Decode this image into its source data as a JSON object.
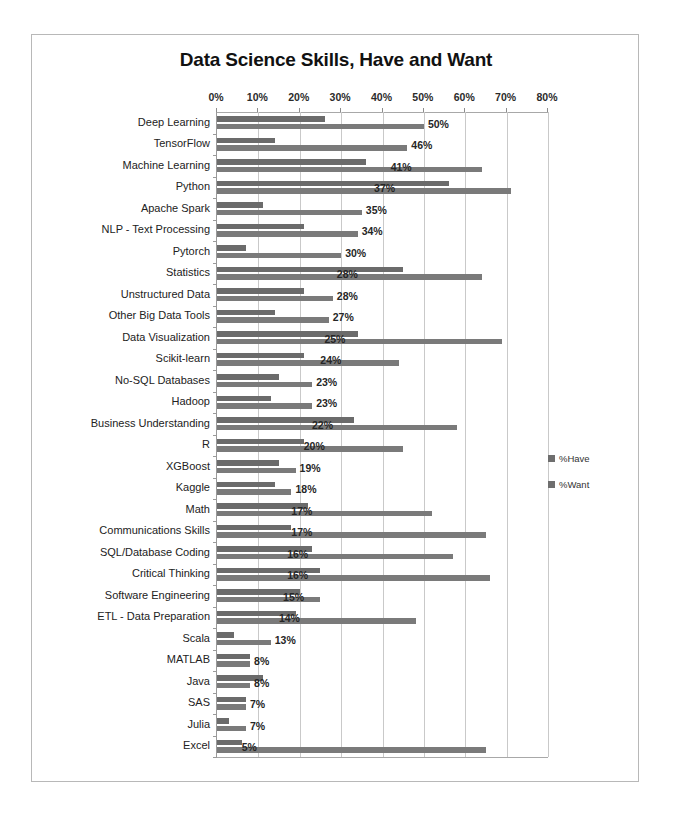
{
  "chart_data": {
    "type": "bar",
    "orientation": "horizontal",
    "title": "Data Science Skills, Have and Want",
    "xlabel": "",
    "ylabel": "",
    "xlim": [
      0,
      80
    ],
    "xtick_labels": [
      "0%",
      "10%",
      "20%",
      "30%",
      "40%",
      "50%",
      "60%",
      "70%",
      "80%"
    ],
    "xtick_values": [
      0,
      10,
      20,
      30,
      40,
      50,
      60,
      70,
      80
    ],
    "grid": true,
    "legend_position": "right",
    "legend": [
      "%Have",
      "%Want"
    ],
    "bar_color": "#6e6e6e",
    "categories": [
      "Deep Learning",
      "TensorFlow",
      "Machine Learning",
      "Python",
      "Apache Spark",
      "NLP - Text Processing",
      "Pytorch",
      "Statistics",
      "Unstructured Data",
      "Other Big Data Tools",
      "Data Visualization",
      "Scikit-learn",
      "No-SQL Databases",
      "Hadoop",
      "Business Understanding",
      "R",
      "XGBoost",
      "Kaggle",
      "Math",
      "Communications Skills",
      "SQL/Database Coding",
      "Critical Thinking",
      "Software Engineering",
      "ETL - Data Preparation",
      "Scala",
      "MATLAB",
      "Java",
      "SAS",
      "Julia",
      "Excel"
    ],
    "series": [
      {
        "name": "%Have",
        "values": [
          26,
          14,
          36,
          56,
          11,
          21,
          7,
          45,
          21,
          14,
          34,
          21,
          15,
          13,
          33,
          21,
          15,
          14,
          22,
          18,
          23,
          25,
          20,
          19,
          4,
          8,
          11,
          7,
          3,
          6
        ]
      },
      {
        "name": "%Want",
        "values": [
          50,
          46,
          64,
          71,
          35,
          34,
          30,
          64,
          28,
          27,
          69,
          44,
          23,
          23,
          58,
          45,
          19,
          18,
          52,
          65,
          57,
          66,
          25,
          48,
          13,
          8,
          8,
          7,
          7,
          65
        ]
      }
    ],
    "data_labels": [
      "50%",
      "46%",
      "41%",
      "37%",
      "35%",
      "34%",
      "30%",
      "28%",
      "28%",
      "27%",
      "25%",
      "24%",
      "23%",
      "23%",
      "22%",
      "20%",
      "19%",
      "18%",
      "17%",
      "17%",
      "16%",
      "16%",
      "15%",
      "14%",
      "13%",
      "8%",
      "8%",
      "7%",
      "7%",
      "5%"
    ]
  }
}
